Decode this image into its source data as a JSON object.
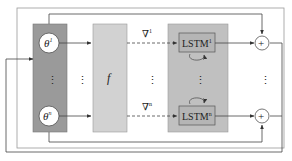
{
  "diagram": {
    "title": "",
    "colors": {
      "theta_block": "#9a9a9a",
      "f_block": "#d2d2d2",
      "lstm_block": "#c0c0c0",
      "lstm_cell": "#b5b5b5",
      "wire": "#444444",
      "node_fill": "#ffffff"
    },
    "nodes": {
      "theta_top": {
        "base": "θ",
        "sup": "1"
      },
      "theta_bottom": {
        "base": "θ",
        "sup": "n"
      },
      "f_label": "f",
      "grad_top": {
        "base": "∇",
        "sup": "1"
      },
      "grad_bottom": {
        "base": "∇",
        "sup": "n"
      },
      "lstm_top": {
        "base": "LSTM",
        "sup": "1"
      },
      "lstm_bottom": {
        "base": "LSTM",
        "sup": "n"
      },
      "sum_top": "+",
      "sum_bottom": "+",
      "ellipsis": "⋮"
    }
  }
}
